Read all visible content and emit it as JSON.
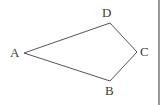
{
  "figure": {
    "type": "geometry-quadrilateral",
    "shape_name": "ABCD",
    "background_color": "#ffffff",
    "stroke_color": "#555555",
    "stroke_width": 1,
    "label_color": "#3b3b3b",
    "vertices": [
      {
        "id": "A",
        "label": "A",
        "x": 24,
        "y": 53,
        "label_x": 10,
        "label_y": 46,
        "label_position": "left"
      },
      {
        "id": "D",
        "label": "D",
        "x": 110,
        "y": 23,
        "label_x": 102,
        "label_y": 6,
        "label_position": "above"
      },
      {
        "id": "C",
        "label": "C",
        "x": 137,
        "y": 52,
        "label_x": 140,
        "label_y": 45,
        "label_position": "right"
      },
      {
        "id": "B",
        "label": "B",
        "x": 110,
        "y": 81,
        "label_x": 105,
        "label_y": 84,
        "label_position": "below"
      }
    ],
    "edges": [
      {
        "id": "AD",
        "from": "A",
        "to": "D",
        "path": "24,53 110,23"
      },
      {
        "id": "DC",
        "from": "D",
        "to": "C",
        "path": "110,23 137,52"
      },
      {
        "id": "CB",
        "from": "C",
        "to": "B",
        "path": "137,52 110,81"
      },
      {
        "id": "BA",
        "from": "B",
        "to": "A",
        "path": "110,81 24,53"
      }
    ],
    "outline_points": "24,53 110,23 137,52 110,81",
    "divider": {
      "orientation": "vertical",
      "x": 158,
      "color": "#9a9a9a",
      "width": 2
    }
  }
}
